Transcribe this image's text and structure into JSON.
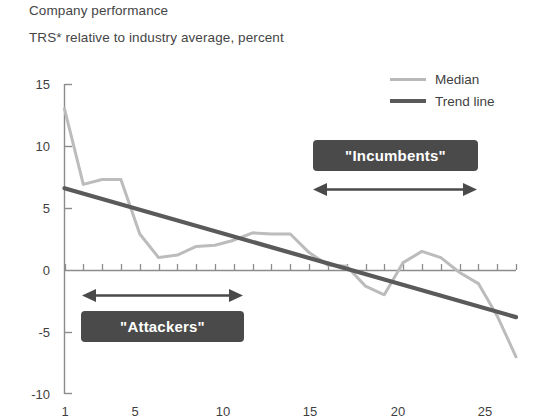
{
  "header": {
    "title": "Company performance",
    "subtitle": "TRS* relative to industry average, percent"
  },
  "legend": {
    "position": "top-right",
    "entries": [
      {
        "label": "Median",
        "color": "#b9b9b9",
        "style": "thin-light-line"
      },
      {
        "label": "Trend line",
        "color": "#5a5a5a",
        "style": "thick-dark-line"
      }
    ]
  },
  "annotations": [
    {
      "name": "incumbents",
      "label": "\"Incumbents\"",
      "arrow_from_x": 14,
      "arrow_to_x": 24,
      "box_color": "#4a4a4a",
      "text_color": "#ffffff"
    },
    {
      "name": "attackers",
      "label": "\"Attackers\"",
      "arrow_from_x": 2,
      "arrow_to_x": 11,
      "box_color": "#4a4a4a",
      "text_color": "#ffffff"
    }
  ],
  "chart_data": {
    "type": "line",
    "title": "Company performance",
    "subtitle": "TRS* relative to industry average, percent",
    "xlabel": "",
    "ylabel": "",
    "xlim": [
      1,
      25
    ],
    "ylim": [
      -10,
      15
    ],
    "yticks": [
      15,
      10,
      5,
      0,
      -5,
      -10
    ],
    "xticks": [
      1,
      5,
      10,
      15,
      20,
      25
    ],
    "xtick_labels": [
      "1",
      "5",
      "10",
      "15",
      "20",
      "25"
    ],
    "ytick_labels": [
      "15",
      "10",
      "5",
      "0",
      "-5",
      "-10"
    ],
    "grid": false,
    "x": [
      1,
      2,
      3,
      4,
      5,
      6,
      7,
      8,
      9,
      10,
      11,
      12,
      13,
      14,
      15,
      16,
      17,
      18,
      19,
      20,
      21,
      22,
      23,
      24,
      25
    ],
    "series": [
      {
        "name": "Median",
        "color": "#b9b9b9",
        "values": [
          13.0,
          6.9,
          7.3,
          7.3,
          2.9,
          1.0,
          1.2,
          1.9,
          2.0,
          2.4,
          3.0,
          2.9,
          2.9,
          1.4,
          0.4,
          0.3,
          -1.3,
          -2.0,
          0.6,
          1.5,
          1.0,
          -0.2,
          -1.1,
          -3.7,
          -7.0
        ]
      },
      {
        "name": "Trend line",
        "color": "#5a5a5a",
        "type": "linear-fit",
        "endpoints": [
          {
            "x": 1,
            "y": 6.6
          },
          {
            "x": 25,
            "y": -3.8
          }
        ]
      }
    ]
  }
}
